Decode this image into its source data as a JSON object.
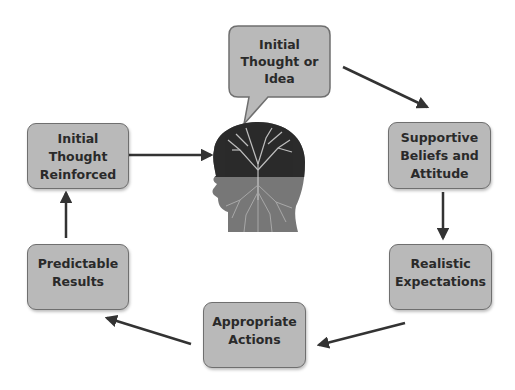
{
  "diagram": {
    "type": "cycle",
    "center_image": "head-with-tree-brain",
    "nodes": [
      {
        "id": "initial_thought",
        "label": "Initial Thought or Idea",
        "lines": [
          "Initial",
          "Thought or",
          "Idea"
        ],
        "shape": "speech-bubble"
      },
      {
        "id": "supportive_beliefs",
        "label": "Supportive Beliefs and Attitude",
        "lines": [
          "Supportive",
          "Beliefs and",
          "Attitude"
        ],
        "shape": "rounded-rect"
      },
      {
        "id": "realistic_expectations",
        "label": "Realistic Expectations",
        "lines": [
          "Realistic",
          "Expectations"
        ],
        "shape": "rounded-rect"
      },
      {
        "id": "appropriate_actions",
        "label": "Appropriate Actions",
        "lines": [
          "Appropriate",
          "Actions"
        ],
        "shape": "rounded-rect"
      },
      {
        "id": "predictable_results",
        "label": "Predictable Results",
        "lines": [
          "Predictable",
          "Results"
        ],
        "shape": "rounded-rect"
      },
      {
        "id": "initial_thought_reinforced",
        "label": "Initial Thought Reinforced",
        "lines": [
          "Initial",
          "Thought",
          "Reinforced"
        ],
        "shape": "rounded-rect"
      }
    ],
    "edges": [
      {
        "from": "initial_thought",
        "to": "supportive_beliefs"
      },
      {
        "from": "supportive_beliefs",
        "to": "realistic_expectations"
      },
      {
        "from": "realistic_expectations",
        "to": "appropriate_actions"
      },
      {
        "from": "appropriate_actions",
        "to": "predictable_results"
      },
      {
        "from": "predictable_results",
        "to": "initial_thought_reinforced"
      },
      {
        "from": "initial_thought_reinforced",
        "to": "head"
      }
    ],
    "colors": {
      "box_fill": "#b9b9b9",
      "box_border": "#6f6f6f",
      "text": "#2a2a2a",
      "arrow": "#333333",
      "head_dark": "#2b2b2b",
      "head_light": "#777777"
    }
  }
}
